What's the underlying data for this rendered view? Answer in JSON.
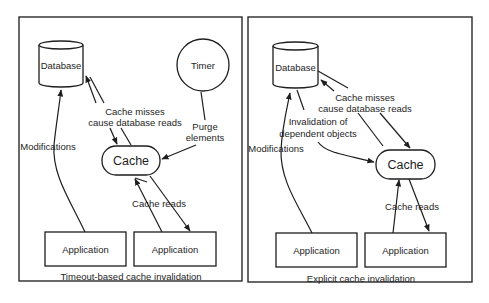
{
  "panels": {
    "left": {
      "caption": "Timeout-based cache invalidation",
      "database": "Database",
      "timer": "Timer",
      "cache": "Cache",
      "app1": "Application",
      "app2": "Application",
      "modifications": "Modifications",
      "misses_line1": "Cache misses",
      "misses_line2": "cause database reads",
      "purge_line1": "Purge",
      "purge_line2": "elements",
      "reads": "Cache reads"
    },
    "right": {
      "caption": "Explicit cache invalidation",
      "database": "Database",
      "cache": "Cache",
      "app1": "Application",
      "app2": "Application",
      "modifications": "Modifications",
      "misses_line1": "Cache misses",
      "misses_line2": "cause database reads",
      "invalidation_line1": "Invalidation of",
      "invalidation_line2": "dependent objects",
      "reads": "Cache reads"
    }
  },
  "colors": {
    "stroke": "#1e1e1e",
    "background": "#ffffff"
  }
}
